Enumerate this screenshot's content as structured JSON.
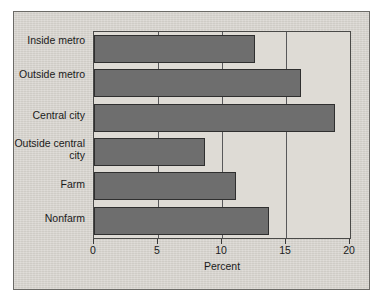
{
  "chart_data": {
    "type": "bar",
    "orientation": "horizontal",
    "title": "",
    "xlabel": "Percent",
    "ylabel": "",
    "categories": [
      "Inside metro",
      "Outside metro",
      "Central city",
      "Outside central city",
      "Farm",
      "Nonfarm"
    ],
    "values": [
      12.6,
      16.2,
      18.8,
      8.7,
      11.1,
      13.7
    ],
    "xlim": [
      0,
      20
    ],
    "xticks": [
      0,
      5,
      10,
      15,
      20
    ],
    "xtick_labels": [
      "0",
      "5",
      "10",
      "15",
      "20"
    ],
    "grid": true,
    "grid_axis": "x",
    "legend": false,
    "legend_position": "none",
    "series": [
      {
        "name": "Percent",
        "values": [
          12.6,
          16.2,
          18.8,
          8.7,
          11.1,
          13.7
        ]
      }
    ]
  },
  "style": {
    "bar_fill": "#6e6e6e",
    "bar_edge": "#2f2f2f",
    "plot_background": "#dedbd5",
    "panel_background": "#d6d3cd",
    "panel_border": "#6b6a66",
    "axis_color": "#3a3a3a",
    "grid_color": "#58585a",
    "text_color": "#1a1a1a",
    "page_background": "#ffffff"
  }
}
